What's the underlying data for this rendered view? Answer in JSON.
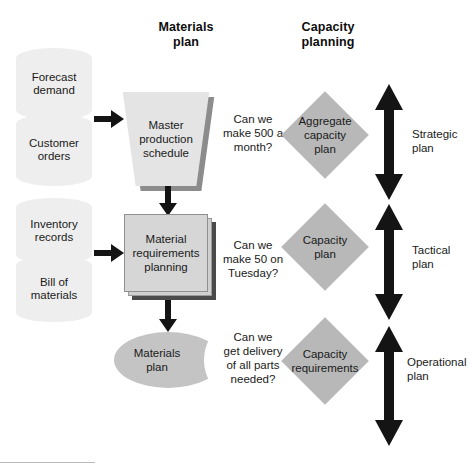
{
  "diagram": {
    "headers": {
      "materials_plan": "Materials\nplan",
      "capacity_planning": "Capacity\nplanning"
    },
    "inputs": [
      {
        "id": "forecast-demand",
        "label": "Forecast\ndemand"
      },
      {
        "id": "customer-orders",
        "label": "Customer\norders"
      },
      {
        "id": "inventory-records",
        "label": "Inventory\nrecords"
      },
      {
        "id": "bill-of-materials",
        "label": "Bill of\nmaterials"
      }
    ],
    "process_nodes": [
      {
        "id": "master-production-schedule",
        "label": "Master\nproduction\nschedule",
        "shape": "trapezoid"
      },
      {
        "id": "material-requirements-planning",
        "label": "Material\nrequirements\nplanning",
        "shape": "stacked-box"
      },
      {
        "id": "materials-plan",
        "label": "Materials\nplan",
        "shape": "horizontal-cylinder"
      }
    ],
    "questions": [
      {
        "id": "question-strategic",
        "label": "Can we\nmake 500 a\nmonth?"
      },
      {
        "id": "question-tactical",
        "label": "Can we\nmake 50 on\nTuesday?"
      },
      {
        "id": "question-operational",
        "label": "Can we\nget delivery\nof all parts\nneeded?"
      }
    ],
    "capacity_nodes": [
      {
        "id": "aggregate-capacity-plan",
        "label": "Aggregate\ncapacity\nplan"
      },
      {
        "id": "capacity-plan",
        "label": "Capacity\nplan"
      },
      {
        "id": "capacity-requirements",
        "label": "Capacity\nrequirements"
      }
    ],
    "plan_levels": [
      {
        "id": "strategic-plan",
        "label": "Strategic\nplan"
      },
      {
        "id": "tactical-plan",
        "label": "Tactical\nplan"
      },
      {
        "id": "operational-plan",
        "label": "Operational\nplan"
      }
    ],
    "colors": {
      "cylinder_light": "#eeeeee",
      "trapezoid_face": "#e4e4e4",
      "box_face": "#d6d6d6",
      "horizontal_cylinder": "#c4c4c4",
      "diamond": "#b8b8b8",
      "arrow": "#1a1a1a",
      "shadow": "#8c8c8c",
      "background": "#ffffff"
    }
  }
}
